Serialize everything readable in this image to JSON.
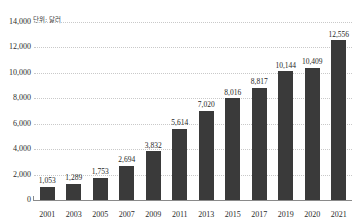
{
  "annotation": {
    "unit_label": "단위: 달러"
  },
  "chart_data": {
    "type": "bar",
    "title": "",
    "xlabel": "",
    "ylabel": "",
    "unit_note": "단위: 달러",
    "categories": [
      "2001",
      "2003",
      "2005",
      "2007",
      "2009",
      "2011",
      "2013",
      "2015",
      "2017",
      "2019",
      "2020",
      "2021"
    ],
    "values": [
      1053,
      1289,
      1753,
      2694,
      3832,
      5614,
      7020,
      8016,
      8817,
      10144,
      10409,
      12556
    ],
    "value_labels": [
      "1,053",
      "1,289",
      "1,753",
      "2,694",
      "3,832",
      "5,614",
      "7,020",
      "8,016",
      "8,817",
      "10,144",
      "10,409",
      "12,556"
    ],
    "ylim": [
      0,
      14000
    ],
    "ytick_values": [
      0,
      2000,
      4000,
      6000,
      8000,
      10000,
      12000,
      14000
    ],
    "ytick_labels": [
      "0",
      "2,000",
      "4,000",
      "6,000",
      "8,000",
      "10,000",
      "12,000",
      "14,000"
    ],
    "grid": true,
    "grid_style": "dotted",
    "legend": "none",
    "bar_color": "#3a3a3a",
    "grid_color": "#c9c9c9",
    "axis_color": "#8a8a8a",
    "background": "#ffffff"
  }
}
